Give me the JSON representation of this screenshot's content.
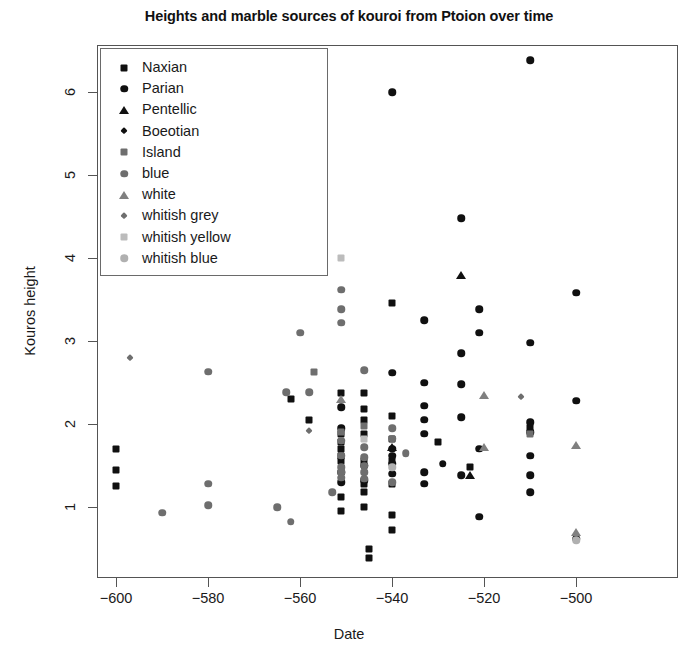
{
  "chart_data": {
    "type": "scatter",
    "title": "Heights and marble sources of kouroi from Ptoion over time",
    "xlabel": "Date",
    "ylabel": "Kouros height",
    "xlim": [
      -608,
      -492
    ],
    "ylim": [
      0.18,
      6.72
    ],
    "xticks": [
      -600,
      -580,
      -560,
      -540,
      -520,
      -500
    ],
    "xtick_labels": [
      "-600",
      "-580",
      "-560",
      "-540",
      "-520",
      "-500"
    ],
    "yticks": [
      1,
      2,
      3,
      4,
      5,
      6
    ],
    "ytick_labels": [
      "1",
      "2",
      "3",
      "4",
      "5",
      "6"
    ],
    "grid": false,
    "legend_position": "top-left",
    "legend_entries": [
      {
        "label": "Naxian",
        "marker": "square",
        "color": "#101010"
      },
      {
        "label": "Parian",
        "marker": "circle",
        "color": "#101010"
      },
      {
        "label": "Pentellic",
        "marker": "triangle",
        "color": "#101010"
      },
      {
        "label": "Boeotian",
        "marker": "diamond",
        "color": "#101010"
      },
      {
        "label": "Island",
        "marker": "square",
        "color": "#6e6e6e"
      },
      {
        "label": "blue",
        "marker": "circle",
        "color": "#6e6e6e"
      },
      {
        "label": "white",
        "marker": "triangle",
        "color": "#808080"
      },
      {
        "label": "whitish grey",
        "marker": "diamond",
        "color": "#6e6e6e"
      },
      {
        "label": "whitish yellow",
        "marker": "square",
        "color": "#bcbcbc"
      },
      {
        "label": "whitish blue",
        "marker": "circle",
        "color": "#b0b0b0"
      }
    ],
    "series": [
      {
        "name": "Naxian",
        "marker": "square",
        "color": "#101010",
        "points": [
          [
            -600,
            1.7
          ],
          [
            -600,
            1.45
          ],
          [
            -600,
            1.25
          ],
          [
            -562,
            2.3
          ],
          [
            -558,
            2.05
          ],
          [
            -551,
            2.37
          ],
          [
            -551,
            1.88
          ],
          [
            -551,
            1.78
          ],
          [
            -551,
            1.7
          ],
          [
            -551,
            1.62
          ],
          [
            -551,
            1.55
          ],
          [
            -551,
            1.12
          ],
          [
            -551,
            0.95
          ],
          [
            -546,
            2.37
          ],
          [
            -546,
            2.18
          ],
          [
            -546,
            2.05
          ],
          [
            -546,
            1.88
          ],
          [
            -546,
            1.56
          ],
          [
            -546,
            1.28
          ],
          [
            -546,
            1.18
          ],
          [
            -546,
            1.0
          ],
          [
            -545,
            0.5
          ],
          [
            -545,
            0.38
          ],
          [
            -540,
            3.46
          ],
          [
            -540,
            2.1
          ],
          [
            -540,
            1.82
          ],
          [
            -540,
            1.55
          ],
          [
            -540,
            1.28
          ],
          [
            -540,
            0.9
          ],
          [
            -540,
            0.72
          ],
          [
            -530,
            1.78
          ],
          [
            -523,
            1.48
          ],
          [
            -510,
            1.95
          ]
        ]
      },
      {
        "name": "Parian",
        "marker": "circle",
        "color": "#101010",
        "points": [
          [
            -551,
            2.2
          ],
          [
            -551,
            1.95
          ],
          [
            -551,
            1.42
          ],
          [
            -551,
            1.3
          ],
          [
            -546,
            1.5
          ],
          [
            -546,
            1.32
          ],
          [
            -540,
            6.0
          ],
          [
            -540,
            2.62
          ],
          [
            -540,
            1.7
          ],
          [
            -540,
            1.62
          ],
          [
            -540,
            1.52
          ],
          [
            -540,
            1.4
          ],
          [
            -533,
            3.25
          ],
          [
            -533,
            2.5
          ],
          [
            -533,
            2.22
          ],
          [
            -533,
            2.05
          ],
          [
            -533,
            1.88
          ],
          [
            -533,
            1.42
          ],
          [
            -533,
            1.28
          ],
          [
            -529,
            1.52
          ],
          [
            -525,
            4.48
          ],
          [
            -525,
            2.85
          ],
          [
            -525,
            2.48
          ],
          [
            -525,
            2.08
          ],
          [
            -525,
            1.38
          ],
          [
            -521,
            3.38
          ],
          [
            -521,
            3.1
          ],
          [
            -521,
            1.7
          ],
          [
            -521,
            0.88
          ],
          [
            -510,
            6.38
          ],
          [
            -510,
            2.98
          ],
          [
            -510,
            2.02
          ],
          [
            -510,
            1.9
          ],
          [
            -510,
            1.62
          ],
          [
            -510,
            1.38
          ],
          [
            -510,
            1.18
          ],
          [
            -500,
            3.58
          ],
          [
            -500,
            2.28
          ],
          [
            -500,
            0.62
          ]
        ]
      },
      {
        "name": "Pentellic",
        "marker": "triangle",
        "color": "#101010",
        "points": [
          [
            -540,
            1.72
          ],
          [
            -523,
            1.38
          ],
          [
            -525,
            3.8
          ]
        ]
      },
      {
        "name": "Boeotian",
        "marker": "diamond",
        "color": "#101010",
        "points": []
      },
      {
        "name": "Island",
        "marker": "square",
        "color": "#6e6e6e",
        "points": [
          [
            -557,
            2.63
          ],
          [
            -551,
            1.9
          ],
          [
            -546,
            1.98
          ],
          [
            -510,
            1.88
          ]
        ]
      },
      {
        "name": "blue",
        "marker": "circle",
        "color": "#6e6e6e",
        "points": [
          [
            -590,
            0.93
          ],
          [
            -580,
            2.63
          ],
          [
            -580,
            1.28
          ],
          [
            -580,
            1.02
          ],
          [
            -565,
            1.0
          ],
          [
            -563,
            2.38
          ],
          [
            -562,
            0.82
          ],
          [
            -560,
            3.1
          ],
          [
            -558,
            2.38
          ],
          [
            -553,
            1.18
          ],
          [
            -551,
            3.62
          ],
          [
            -551,
            3.38
          ],
          [
            -551,
            3.22
          ],
          [
            -551,
            1.8
          ],
          [
            -551,
            1.62
          ],
          [
            -551,
            1.48
          ],
          [
            -551,
            1.42
          ],
          [
            -551,
            1.35
          ],
          [
            -546,
            2.65
          ],
          [
            -546,
            1.72
          ],
          [
            -546,
            1.6
          ],
          [
            -546,
            1.5
          ],
          [
            -546,
            1.42
          ],
          [
            -546,
            1.34
          ],
          [
            -540,
            1.95
          ],
          [
            -540,
            1.82
          ],
          [
            -540,
            1.3
          ],
          [
            -537,
            1.65
          ]
        ]
      },
      {
        "name": "white",
        "marker": "triangle",
        "color": "#808080",
        "points": [
          [
            -551,
            2.3
          ],
          [
            -520,
            2.35
          ],
          [
            -520,
            1.72
          ],
          [
            -500,
            1.75
          ],
          [
            -500,
            0.7
          ]
        ]
      },
      {
        "name": "whitish grey",
        "marker": "diamond",
        "color": "#6e6e6e",
        "points": [
          [
            -597,
            2.8
          ],
          [
            -566,
            3.88
          ],
          [
            -558,
            1.92
          ],
          [
            -512,
            2.32
          ]
        ]
      },
      {
        "name": "whitish yellow",
        "marker": "square",
        "color": "#bcbcbc",
        "points": [
          [
            -551,
            4.0
          ],
          [
            -546,
            1.82
          ]
        ]
      },
      {
        "name": "whitish blue",
        "marker": "circle",
        "color": "#b0b0b0",
        "points": [
          [
            -540,
            1.48
          ],
          [
            -500,
            0.6
          ]
        ]
      }
    ]
  }
}
